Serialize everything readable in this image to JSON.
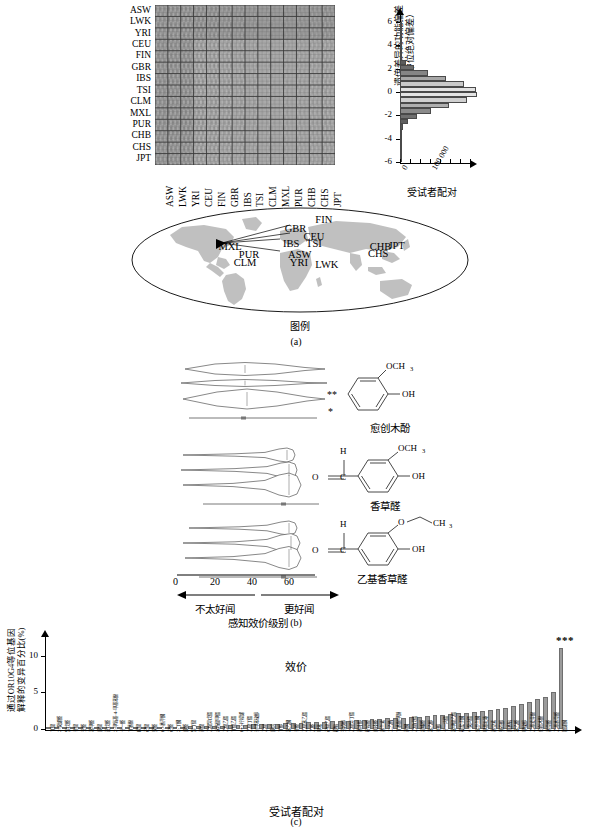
{
  "figure": {
    "panel_a_caption": "(a)",
    "panel_b_caption": "(b)",
    "panel_c_caption": "(c)"
  },
  "panel_a": {
    "heatmap": {
      "populations": [
        "ASW",
        "LWK",
        "YRI",
        "CEU",
        "FIN",
        "GBR",
        "IBS",
        "TSI",
        "CLM",
        "MXL",
        "PUR",
        "CHB",
        "CHS",
        "JPT"
      ],
      "colormap": "grayscale"
    },
    "histogram": {
      "y_ticks": [
        "6",
        "4",
        "2",
        "0",
        "-2",
        "-4",
        "-6"
      ],
      "y_label": "遗传差异的功能偏差\n（中位绝对偏差）",
      "y_label_line1": "遗传差异的功能偏差",
      "y_label_line2": "（中位绝对偏差）",
      "x_tick_zero": "0",
      "x_tick_max": "100 000",
      "x_label": "受试者配对",
      "ylim": [
        -6.5,
        6.5
      ]
    },
    "map": {
      "legend_label": "图例",
      "populations": [
        {
          "code": "FIN",
          "x": 0.545,
          "y": 0.085
        },
        {
          "code": "GBR",
          "x": 0.455,
          "y": 0.165
        },
        {
          "code": "CEU",
          "x": 0.51,
          "y": 0.235
        },
        {
          "code": "IBS",
          "x": 0.45,
          "y": 0.3
        },
        {
          "code": "TSI",
          "x": 0.518,
          "y": 0.3
        },
        {
          "code": "MXL",
          "x": 0.26,
          "y": 0.33
        },
        {
          "code": "PUR",
          "x": 0.32,
          "y": 0.4
        },
        {
          "code": "CLM",
          "x": 0.305,
          "y": 0.47
        },
        {
          "code": "ASW",
          "x": 0.465,
          "y": 0.4
        },
        {
          "code": "YRI",
          "x": 0.47,
          "y": 0.47
        },
        {
          "code": "LWK",
          "x": 0.545,
          "y": 0.495
        },
        {
          "code": "CHB",
          "x": 0.705,
          "y": 0.325
        },
        {
          "code": "JPT",
          "x": 0.76,
          "y": 0.315
        },
        {
          "code": "CHS",
          "x": 0.7,
          "y": 0.39
        }
      ]
    }
  },
  "panel_b": {
    "x_ticks": [
      "0",
      "20",
      "40",
      "60"
    ],
    "x_tick_values": [
      0,
      20,
      40,
      60
    ],
    "direction_left": "不太好闻",
    "direction_right": "更好闻",
    "axis_label": "感知效价级别",
    "compounds": [
      {
        "name": "愈创木酚",
        "name_en": "guaiacol",
        "significance": [
          "",
          "",
          "**",
          "*"
        ]
      },
      {
        "name": "香草醛",
        "name_en": "vanillin",
        "significance": [
          "",
          "",
          "",
          ""
        ]
      },
      {
        "name": "乙基香草醛",
        "name_en": "ethylvanillin",
        "significance": [
          "",
          "",
          "",
          ""
        ]
      }
    ],
    "chem_labels": {
      "och3": "OCH₃",
      "oh": "OH",
      "h": "H",
      "o": "O",
      "c": "C",
      "ch3": "CH₃"
    }
  },
  "chart_data": {
    "type": "bar",
    "title": "效价",
    "ylabel": "通过OR10G4等位基因解释的变异百分比(%)",
    "ylabel_italic_part": "OR10G4",
    "ylabel_line1": "通过OR10G4等位基因",
    "ylabel_line2": "解释的变异百分比(%)",
    "xlabel": "受试者配对",
    "y_ticks": [
      "0",
      "5",
      "10"
    ],
    "y_tick_values": [
      0,
      5,
      10
    ],
    "ylim": [
      0,
      11.6
    ],
    "grid": false,
    "legend": "none",
    "significance_marker": "***",
    "significance_index": 65,
    "categories": [
      "丁酸",
      "2-癸烯醛",
      "异戊醛",
      "辛酸",
      "壬醛",
      "苯甲醛",
      "庚酸",
      "正戊醛",
      "2-甲氧基-4-甲基苯酚",
      "十一醛",
      "丁香酚",
      "戊酸",
      "己酸",
      "癸醛",
      "(-)-香芹酮",
      "己醛",
      "2-丁酮",
      "庚醛",
      "异丁酸",
      "丙酸",
      "乙酸异戊酯",
      "水杨酸甲酯",
      "乙酸乙酯",
      "丁酸乙酯",
      "(+)-柠檬烯",
      "乙酸丁酯",
      "对甲苯硫醇",
      "乙酸",
      "庚烷",
      "丁醇",
      "苯乙酮",
      "辛醛",
      "乙酸苯乙酯",
      "乙醛",
      "甲苯",
      "己酸乙酯",
      "樟脑",
      "芳樟醇",
      "乙酸异丁酯",
      "香叶醇",
      "柠檬醛",
      "肉桂醛",
      "香兰素",
      "二乙酰",
      "丁香酚甲醚",
      "丙酮",
      "乙酸戊酯",
      "胡椒醛",
      "苯乙醇",
      "辛醇",
      "十一内酯",
      "苯甲酸乙酯",
      "覆盆子酮",
      "γ-癸内酯",
      "紫罗兰酮",
      "甲基吡嗪",
      "香豆素",
      "薄荷醇",
      "茴香脑",
      "苯乙醛",
      "甲硫醇",
      "乙基麦芽酚",
      "愈创木酚",
      "香草醛",
      "乙基香草醛",
      "雄烯酮"
    ],
    "values": [
      0.07,
      0.09,
      0.1,
      0.12,
      0.13,
      0.14,
      0.15,
      0.16,
      0.18,
      0.19,
      0.21,
      0.22,
      0.24,
      0.26,
      0.28,
      0.3,
      0.32,
      0.34,
      0.36,
      0.38,
      0.4,
      0.44,
      0.47,
      0.5,
      0.55,
      0.58,
      0.62,
      0.66,
      0.7,
      0.74,
      0.78,
      0.82,
      0.86,
      0.9,
      0.95,
      1.0,
      1.05,
      1.1,
      1.15,
      1.2,
      1.26,
      1.32,
      1.38,
      1.44,
      1.5,
      1.56,
      1.62,
      1.7,
      1.78,
      1.86,
      1.94,
      2.02,
      2.12,
      2.22,
      2.32,
      2.44,
      2.58,
      2.74,
      2.92,
      3.12,
      3.4,
      3.75,
      4.1,
      4.4,
      5.0,
      11.0
    ]
  }
}
